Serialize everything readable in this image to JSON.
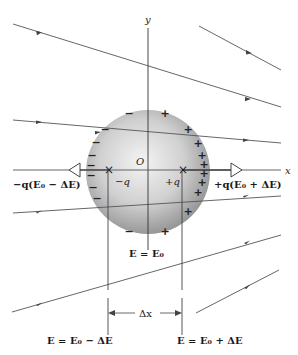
{
  "diagram": {
    "axes": {
      "x_label": "x",
      "y_label": "y",
      "origin_label": "O"
    },
    "charges": {
      "negative_point": "×",
      "positive_point": "×",
      "negative_label": "−q",
      "positive_label": "+q",
      "surface_negative": "−",
      "surface_positive": "+"
    },
    "forces": {
      "left": "−q(E₀ − ΔE)",
      "right": "+q(E₀ + ΔE)"
    },
    "field_labels": {
      "center": "E = E₀",
      "left": "E = E₀ − ΔE",
      "right": "E = E₀ + ΔE"
    },
    "separation_label": "Δx",
    "colors": {
      "line": "#555555",
      "sphere_light": "#f2f2f2",
      "sphere_dark": "#9a9a9a"
    }
  }
}
